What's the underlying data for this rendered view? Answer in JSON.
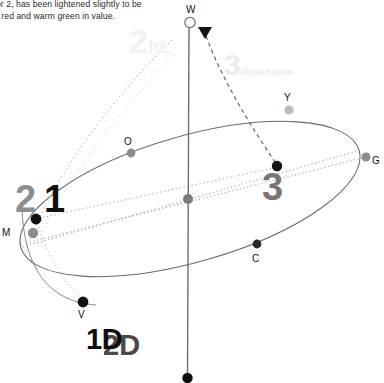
{
  "canvas": {
    "width": 384,
    "height": 383,
    "background": "#ffffff"
  },
  "caption": {
    "line1": "lor 2, has been lightened slightly to be",
    "line2": "o red and warm green in value."
  },
  "colors": {
    "axis": "#6f6f6f",
    "ellipse": "#6b6b6b",
    "dotted_guide": "#9a9a9a",
    "dashed_arc": "#5a5a5a",
    "marker_dark": "#121212",
    "marker_mid": "#8b8b8b",
    "marker_light": "#b9b9b9",
    "label_text": "#111111",
    "num1": "#0f0f0f",
    "num2": "#8e8e8e",
    "num3": "#7a7472",
    "ghost": "#ededee"
  },
  "axis": {
    "name": "value-axis",
    "top": {
      "label": "W",
      "x": 190,
      "y": 22,
      "style": "hollow-circle"
    },
    "bottom": {
      "label": "",
      "x": 187,
      "y": 378,
      "style": "filled-circle"
    },
    "center": {
      "label": "",
      "x": 188,
      "y": 199,
      "style": "filled-circle-mid"
    }
  },
  "hue_points": [
    {
      "id": "O",
      "label": "O",
      "x": 131,
      "y": 153,
      "marker": "mid",
      "label_dx": -4,
      "label_dy": -18
    },
    {
      "id": "Y",
      "label": "Y",
      "x": 289,
      "y": 110,
      "marker": "light",
      "label_dx": -4,
      "label_dy": -18
    },
    {
      "id": "G",
      "label": "G",
      "x": 366,
      "y": 157,
      "marker": "mid",
      "label_dx": 7,
      "label_dy": -5
    },
    {
      "id": "C",
      "label": "C",
      "x": 257,
      "y": 244,
      "marker": "dark",
      "label_dx": -4,
      "label_dy": 8
    },
    {
      "id": "V",
      "label": "V",
      "x": 83,
      "y": 302,
      "marker": "dark",
      "label_dx": -4,
      "label_dy": 8
    },
    {
      "id": "M",
      "label": "M",
      "x": 33,
      "y": 233,
      "marker": "dark",
      "label_dx": -27,
      "label_dy": -5
    }
  ],
  "swatch_points": [
    {
      "id": "1",
      "label": "1",
      "x": 35,
      "y": 219,
      "marker": "dark"
    },
    {
      "id": "2",
      "label": "2",
      "x": 18,
      "y": 234,
      "marker": "mid"
    },
    {
      "id": "3",
      "label": "3",
      "x": 277,
      "y": 167,
      "marker": "dark"
    }
  ],
  "numbers": {
    "one": {
      "text": "1"
    },
    "two": {
      "text": "2"
    },
    "three": {
      "text": "3"
    }
  },
  "ghost_labels": {
    "highlight": {
      "main": "2",
      "sub": "hL"
    },
    "illumination": {
      "main": "3",
      "sub": "illumination"
    }
  },
  "dimension_labels": {
    "one_d": "1D",
    "two_d": "2D"
  },
  "arrow": {
    "name": "illumination-arrow",
    "tip_x": 205,
    "tip_y": 30,
    "direction": "down-left"
  }
}
